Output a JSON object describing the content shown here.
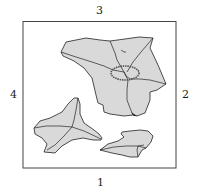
{
  "diagram": {
    "type": "torn-paper-pieces-in-square-frame",
    "side_labels": {
      "top": "3",
      "right": "2",
      "bottom": "1",
      "left": "4"
    },
    "colors": {
      "frame": "#444444",
      "piece_fill": "#d9d9d9",
      "piece_stroke": "#222222",
      "circle_mark": "#555555"
    },
    "pieces": [
      {
        "name": "large-piece",
        "note": "top-center large torn piece with fold lines and circled mark"
      },
      {
        "name": "left-piece",
        "note": "bottom-left three-pointed piece with fold lines"
      },
      {
        "name": "right-piece",
        "note": "bottom-right small piece with fold lines"
      }
    ]
  }
}
